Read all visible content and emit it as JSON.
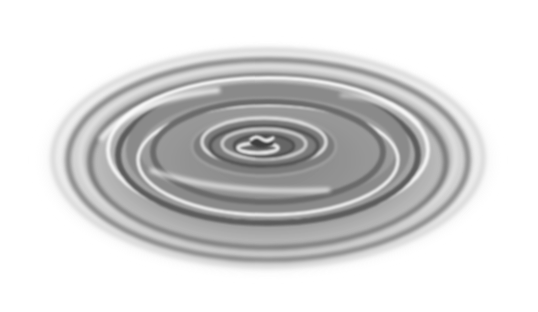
{
  "image": {
    "subject": "Concentric water ripples",
    "description": "Grayscale rendering of circular ripples spreading outward on a liquid surface, viewed at an oblique angle, with a small droplet disturbance at the center.",
    "palette": {
      "background": "#ffffff",
      "light": "#f2f2f2",
      "mid": "#9a9a9a",
      "dark": "#5a5a5a",
      "highlight": "#ffffff"
    }
  }
}
